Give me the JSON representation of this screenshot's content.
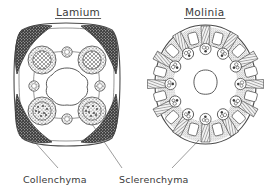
{
  "figure": {
    "kind": "botanical-cross-section-comparison",
    "background_color": "#ffffff",
    "ink_color": "#3a3a3a",
    "panels": [
      {
        "id": "lamium",
        "title": "Lamium",
        "title_underlined": true,
        "shape": "square-rounded",
        "description_tissues": [
          "collenchyma",
          "sclerenchyma",
          "vascular-bundle",
          "pith-cavity",
          "epidermis"
        ],
        "vascular_bundle_count": 4,
        "corner_collenchyma_count": 4,
        "interfascicular_bundle_count": 4,
        "center": "hollow-wavy-pith-cavity"
      },
      {
        "id": "molinia",
        "title": "Molinia",
        "title_underlined": true,
        "shape": "circular-ring",
        "description_tissues": [
          "sclerenchyma",
          "vascular-bundle",
          "air-space",
          "epidermis",
          "parenchyma"
        ],
        "vascular_bundle_count": 12,
        "sclerenchyma_ray_count": 12,
        "air_space_count": 12,
        "center": "central-cavity"
      }
    ],
    "labels": [
      {
        "id": "collenchyma",
        "text": "Collenchyma",
        "points_to": "lamium-corner-collenchyma"
      },
      {
        "id": "sclerenchyma",
        "text": "Sclerenchyma",
        "points_to": "lamium-lower-bundle-and-molinia-ring"
      }
    ]
  }
}
